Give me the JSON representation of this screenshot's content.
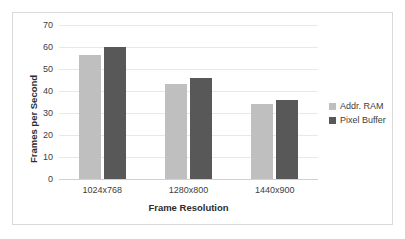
{
  "chart_data": {
    "type": "bar",
    "title": "",
    "xlabel": "Frame Resolution",
    "ylabel": "Frames per Second",
    "categories": [
      "1024x768",
      "1280x800",
      "1440x900"
    ],
    "series": [
      {
        "name": "Addr. RAM",
        "color": "#bfbfbf",
        "values": [
          56.5,
          43,
          34
        ]
      },
      {
        "name": "Pixel Buffer",
        "color": "#585858",
        "values": [
          60,
          46,
          36
        ]
      }
    ],
    "ylim": [
      0,
      70
    ],
    "yticks": [
      0,
      10,
      20,
      30,
      40,
      50,
      60,
      70
    ],
    "ytick_labels": [
      "0",
      "10",
      "20",
      "30",
      "40",
      "50",
      "60",
      "70"
    ],
    "grid": true,
    "grid_axis": "y",
    "legend_position": "right",
    "plot_background": "#ffffff",
    "border_color": "#d9d9d9"
  }
}
